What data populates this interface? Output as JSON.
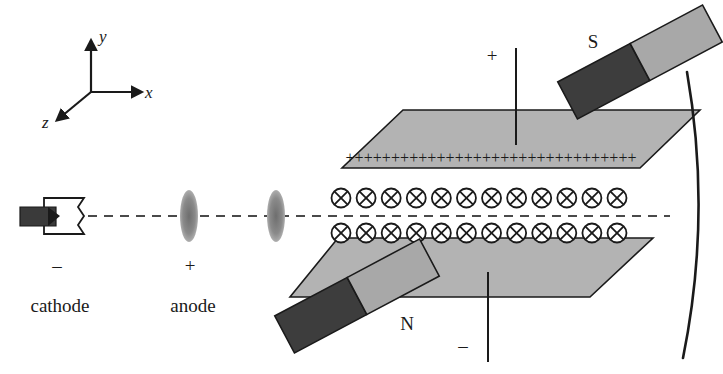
{
  "figure": {
    "background_color": "#ffffff",
    "ink_color": "#1a1a1a",
    "plate_fill": "#b3b3b3",
    "magnet_dark_fill": "#3d3d3d",
    "magnet_light_fill": "#a8a8a8",
    "lens_fill": "#7a7a7a"
  },
  "axes": {
    "y_label": "y",
    "x_label": "x",
    "z_label": "z"
  },
  "source": {
    "cathode_sign": "–",
    "cathode_label": "cathode",
    "anode_sign": "+",
    "anode_label": "anode"
  },
  "plates": {
    "top_charge_sign": "+",
    "top_charge_count": 32,
    "bottom_charge_sign": "–",
    "bottom_charge_count": 1,
    "terminal_positive": "+",
    "terminal_negative": "–"
  },
  "field": {
    "symbol": "⊗",
    "row_count": 2,
    "per_row_count": 12,
    "description": "magnetic field into the page"
  },
  "magnets": {
    "top_label": "S",
    "bottom_label": "N"
  },
  "screen": {
    "description": "curved detector screen"
  }
}
